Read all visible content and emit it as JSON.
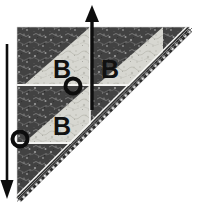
{
  "figure": {
    "kind": "quilt-assembly-diagram"
  },
  "colors": {
    "background": "#ffffff",
    "dark_floral": "#4a4a4a",
    "dark_floral_alt": "#3a3a3a",
    "light_floral": "#d9d9d4",
    "light_floral_alt": "#c3c3bc",
    "binding_dark": "#2e2e2e",
    "binding_dash": "#f2f2f2",
    "seam_line": "#f4f4f2",
    "ink": "#111111"
  },
  "blocks": [
    {
      "id": "block-top-left",
      "label": "B",
      "row": 0,
      "col": 0
    },
    {
      "id": "block-top-right",
      "label": "B",
      "row": 0,
      "col": 1
    },
    {
      "id": "block-bottom-left",
      "label": "B",
      "row": 1,
      "col": 0
    },
    {
      "id": "block-bottom-right",
      "label": "",
      "row": 1,
      "col": 1
    }
  ],
  "arrows": [
    {
      "id": "arrow-up",
      "direction": "up",
      "label": ""
    },
    {
      "id": "arrow-down",
      "direction": "down",
      "label": ""
    }
  ],
  "markers": [
    {
      "id": "seam-marker-center",
      "shape": "circle",
      "label": ""
    },
    {
      "id": "seam-marker-lower-left",
      "shape": "circle",
      "label": ""
    }
  ],
  "caption": {
    "text": ""
  }
}
